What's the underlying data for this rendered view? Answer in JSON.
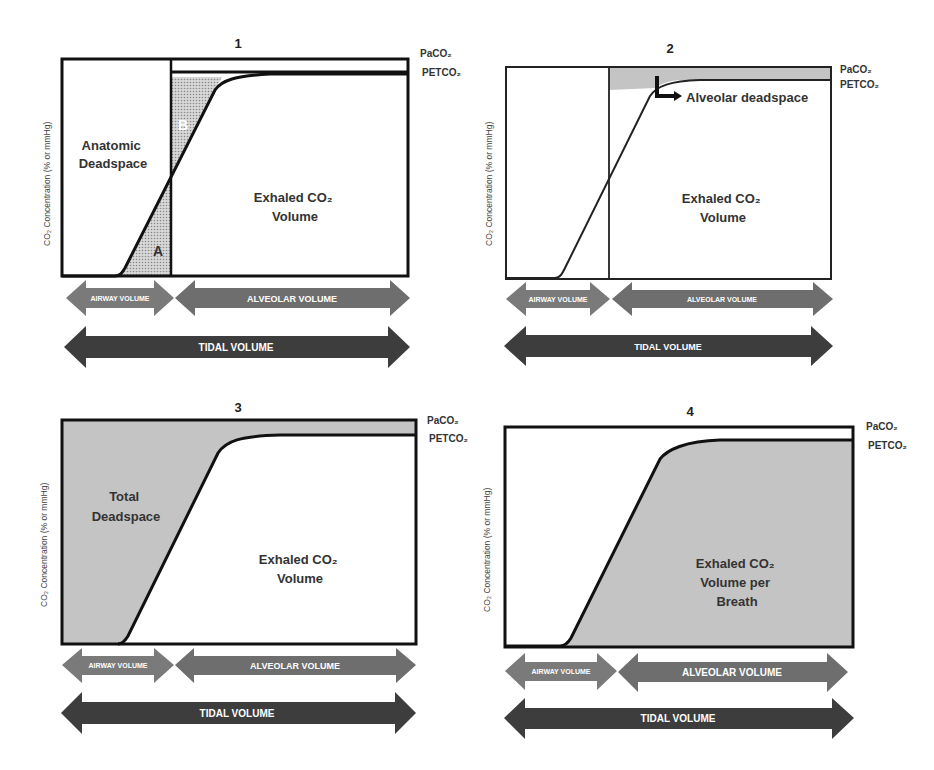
{
  "panels": [
    {
      "number": "1",
      "y_axis_label": "CO₂ Concentration (% or mmHg)",
      "right_labels": {
        "top": "PaCO₂",
        "bottom": "PETCO₂"
      },
      "regions": {
        "left": [
          "Anatomic",
          "Deadspace"
        ],
        "right": [
          "Exhaled CO₂",
          "Volume"
        ],
        "area_a": "A",
        "area_b": "B"
      },
      "arrows": {
        "airway": "AIRWAY  VOLUME",
        "alveolar": "ALVEOLAR VOLUME",
        "tidal": "TIDAL  VOLUME"
      }
    },
    {
      "number": "2",
      "y_axis_label": "CO₂ Concentration (% or mmHg)",
      "right_labels": {
        "top": "PaCO₂",
        "bottom": "PETCO₂"
      },
      "regions": {
        "callout": "Alveolar deadspace",
        "right": [
          "Exhaled CO₂",
          "Volume"
        ]
      },
      "arrows": {
        "airway": "AIRWAY VOLUME",
        "alveolar": "ALVEOLAR VOLUME",
        "tidal": "TIDAL VOLUME"
      }
    },
    {
      "number": "3",
      "y_axis_label": "CO₂ Concentration (% or mmHg)",
      "right_labels": {
        "top": "PaCO₂",
        "bottom": "PETCO₂"
      },
      "regions": {
        "left": [
          "Total",
          "Deadspace"
        ],
        "right": [
          "Exhaled CO₂",
          "Volume"
        ]
      },
      "arrows": {
        "airway": "AIRWAY  VOLUME",
        "alveolar": "ALVEOLAR VOLUME",
        "tidal": "TIDAL  VOLUME"
      }
    },
    {
      "number": "4",
      "y_axis_label": "CO₂ Concentration (% or mmHg)",
      "right_labels": {
        "top": "PaCO₂",
        "bottom": "PETCO₂"
      },
      "regions": {
        "right": [
          "Exhaled CO₂",
          "Volume per",
          "Breath"
        ]
      },
      "arrows": {
        "airway": "AIRWAY  VOLUME",
        "alveolar": "ALVEOLAR VOLUME",
        "tidal": "TIDAL  VOLUME"
      }
    }
  ],
  "colors": {
    "shade": "#c4c4c4",
    "airway_arrow": "#7a7a7a",
    "alveolar_arrow": "#6e6e6e",
    "tidal_arrow": "#3d3d3d",
    "outline": "#111111"
  }
}
